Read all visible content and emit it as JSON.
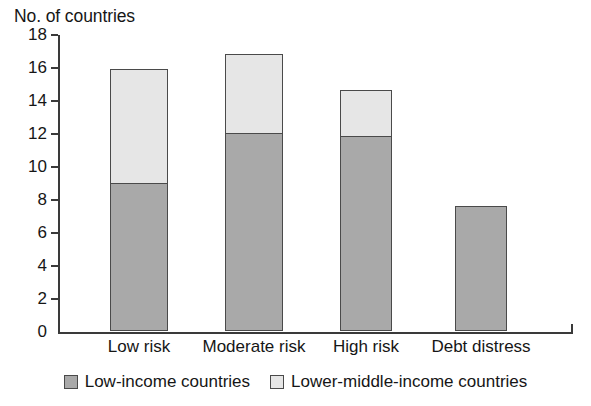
{
  "chart_data": {
    "type": "bar",
    "subtype": "stacked-vertical",
    "title": "No. of countries",
    "xlabel": "",
    "ylabel": "No. of countries",
    "ylim": [
      0,
      18
    ],
    "ytick_step": 2,
    "yticks": [
      0,
      2,
      4,
      6,
      8,
      10,
      12,
      14,
      16,
      18
    ],
    "ytick_labels": [
      "0",
      "2",
      "4",
      "6",
      "8",
      "10",
      "12",
      "14",
      "16",
      "18"
    ],
    "grid": false,
    "legend_position": "bottom-center",
    "categories": [
      "Low risk",
      "Moderate risk",
      "High risk",
      "Debt distress"
    ],
    "series": [
      {
        "name": "Low-income countries",
        "color": "#a9a9a9",
        "values": [
          9,
          12,
          11.8,
          7.6
        ]
      },
      {
        "name": "Lower-middle-income countries",
        "color": "#e6e6e6",
        "values": [
          7,
          4.9,
          2.9,
          0
        ]
      }
    ],
    "totals": [
      16,
      16.9,
      14.7,
      7.6
    ]
  },
  "legend": {
    "items": [
      {
        "label": "Low-income countries",
        "swatch_color": "#a9a9a9"
      },
      {
        "label": "Lower-middle-income countries",
        "swatch_color": "#e6e6e6"
      }
    ]
  },
  "style": {
    "axis_color": "#3a3a3a",
    "bar_border_color": "#4a4a4a",
    "text_color": "#161616",
    "background": "#ffffff"
  }
}
